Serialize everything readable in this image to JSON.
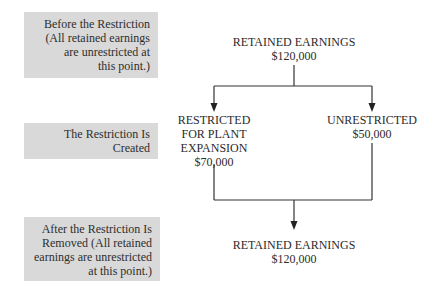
{
  "stages": [
    {
      "lines": [
        "Before the Restriction",
        "(All retained earnings",
        "are unrestricted at",
        "this point.)"
      ]
    },
    {
      "lines": [
        "The Restriction Is",
        "Created"
      ]
    },
    {
      "lines": [
        "After the Restriction Is",
        "Removed (All retained",
        "earnings are unrestricted",
        "at this point.)"
      ]
    }
  ],
  "nodes": {
    "top": {
      "title": "RETAINED EARNINGS",
      "amount": "$120,000"
    },
    "restricted": {
      "lines": [
        "RESTRICTED",
        "FOR PLANT",
        "EXPANSION"
      ],
      "amount": "$70,000"
    },
    "unrestricted": {
      "title": "UNRESTRICTED",
      "amount": "$50,000"
    },
    "bottom": {
      "title": "RETAINED EARNINGS",
      "amount": "$120,000"
    }
  },
  "colors": {
    "stage_fill": "#d9d9d9",
    "line": "#333333"
  }
}
